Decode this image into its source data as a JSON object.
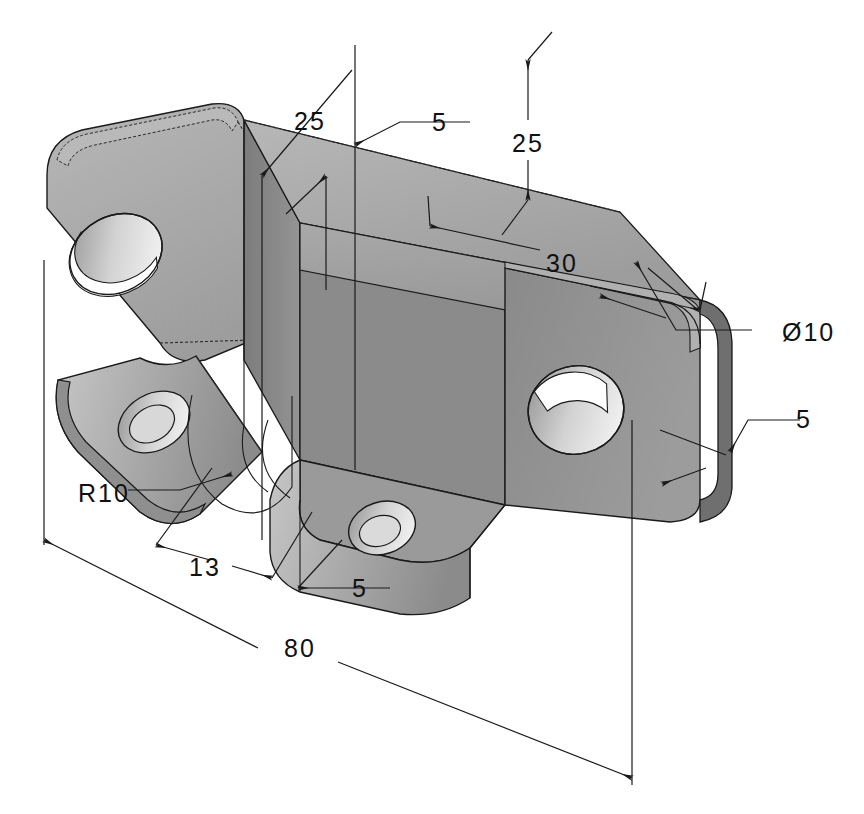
{
  "drawing": {
    "title": "Isometric bracket - dimensioned technical drawing",
    "type": "isometric-engineering-drawing",
    "background_color": "#ffffff",
    "line_color": "#1a1a1a",
    "shading": {
      "top_face": "#a8a8a8",
      "top_face_light": "#b4b4b4",
      "front_face": "#8f8f8f",
      "side_face_dark": "#7d7d7d",
      "rib_face": "#8a8a8a",
      "edge_band": "#9d9d9d",
      "hole_inner_light": "#c8c8c8",
      "hole_inner_dark": "#8a8a8a",
      "hole_bore": "#ffffff"
    }
  },
  "dimensions": [
    {
      "id": "dim-25-left",
      "label": "25",
      "x": 310,
      "y": 130,
      "kind": "leader"
    },
    {
      "id": "dim-5-top",
      "label": "5",
      "x": 440,
      "y": 122,
      "kind": "leader"
    },
    {
      "id": "dim-25-right",
      "label": "25",
      "x": 528,
      "y": 152,
      "kind": "linear-vertical"
    },
    {
      "id": "dim-30",
      "label": "30",
      "x": 562,
      "y": 272,
      "kind": "linear-diagonal"
    },
    {
      "id": "dim-dia-10",
      "label": "Ø10",
      "x": 782,
      "y": 340,
      "kind": "leader-diameter"
    },
    {
      "id": "dim-5-right",
      "label": "5",
      "x": 795,
      "y": 425,
      "kind": "leader"
    },
    {
      "id": "dim-r10",
      "label": "R10",
      "x": 78,
      "y": 494,
      "kind": "leader-radius"
    },
    {
      "id": "dim-13",
      "label": "13",
      "x": 188,
      "y": 568,
      "kind": "linear-diagonal"
    },
    {
      "id": "dim-5-bottom",
      "label": "5",
      "x": 352,
      "y": 594,
      "kind": "leader"
    },
    {
      "id": "dim-80",
      "label": "80",
      "x": 298,
      "y": 648,
      "kind": "linear-diagonal"
    }
  ],
  "annotation_values": {
    "plate_length": 80,
    "plate_thickness": 5,
    "flange_height_front": 25,
    "flange_height_back": 25,
    "web_offset": 30,
    "tab_width": 13,
    "hole_diameter": 10,
    "corner_radius": 10
  }
}
